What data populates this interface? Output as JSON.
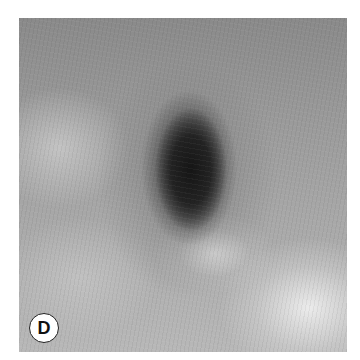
{
  "figure": {
    "panel_label": "D"
  }
}
